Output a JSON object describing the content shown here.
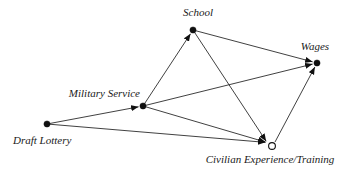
{
  "diagram": {
    "background": "#ffffff",
    "line_color": "#2b2b2b",
    "node_color": "#101010",
    "text_color": "#1a1a1a",
    "nodes": [
      {
        "id": "school",
        "label": "School",
        "x": 193,
        "y": 30,
        "style": "filled"
      },
      {
        "id": "wages",
        "label": "Wages",
        "x": 317,
        "y": 63,
        "style": "filled"
      },
      {
        "id": "military_service",
        "label": "Military Service",
        "x": 143,
        "y": 106,
        "style": "filled"
      },
      {
        "id": "draft_lottery",
        "label": "Draft Lottery",
        "x": 47,
        "y": 124,
        "style": "filled"
      },
      {
        "id": "civilian_experience",
        "label": "Civilian Experience/Training",
        "x": 272,
        "y": 146,
        "style": "open",
        "in_x": 267,
        "in_y": 142.5,
        "out_x": 275,
        "out_y": 142,
        "arrow_gap": 1.5
      }
    ],
    "edges": [
      {
        "from": "draft_lottery",
        "to": "military_service"
      },
      {
        "from": "draft_lottery",
        "to": "civilian_experience"
      },
      {
        "from": "military_service",
        "to": "school"
      },
      {
        "from": "military_service",
        "to": "wages"
      },
      {
        "from": "military_service",
        "to": "civilian_experience"
      },
      {
        "from": "school",
        "to": "wages"
      },
      {
        "from": "school",
        "to": "civilian_experience"
      },
      {
        "from": "civilian_experience",
        "to": "wages"
      }
    ]
  }
}
